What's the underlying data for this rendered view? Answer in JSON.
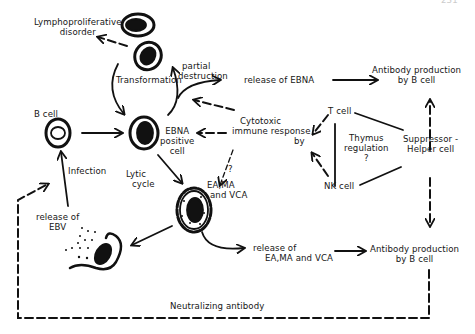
{
  "page_number": "231",
  "diagram": {
    "labels": {
      "lymphoproliferative_l1": "Lymphoproliferative",
      "lymphoproliferative_l2": "disorder",
      "transformation": "Transformation",
      "partial_l1": "partial",
      "partial_l2": "destruction",
      "release_ebna": "release of EBNA",
      "antibody_top_l1": "Antibody  production",
      "antibody_top_l2": "by   B  cell",
      "b_cell": "B cell",
      "ebna_l1": "EBNA",
      "ebna_l2": "positive",
      "ebna_l3": "cell",
      "cytotoxic_l1": "Cytotoxic",
      "cytotoxic_l2": "immune response",
      "cytotoxic_l3": "by",
      "t_cell": "T cell",
      "thymus_l1": "Thymus",
      "thymus_l2": "regulation",
      "thymus_l3": "?",
      "suppressor_l1": "Suppressor -",
      "suppressor_l2": "Helper  cell",
      "infection": "Infection",
      "lytic_l1": "Lytic",
      "lytic_l2": "cycle",
      "question_mark": "?",
      "ea_l1": "EA,MA",
      "ea_l2": "and VCA",
      "nk_cell": "NK cell",
      "release_ebv_l1": "release  of",
      "release_ebv_l2": "EBV",
      "release_ea_l1": "release  of",
      "release_ea_l2": "EA,MA and VCA",
      "antibody_bottom_l1": "Antibody  production",
      "antibody_bottom_l2": "by    B  cell",
      "neutralizing": "Neutralizing    antibody"
    },
    "nodes": [
      {
        "id": "transformed-cell-top",
        "type": "cell-dark-nucleus"
      },
      {
        "id": "transformed-cell",
        "type": "cell-dark-nucleus"
      },
      {
        "id": "b-cell",
        "type": "cell-hollow-nucleus"
      },
      {
        "id": "ebna-positive-cell",
        "type": "cell-dark-nucleus"
      },
      {
        "id": "lytic-cell",
        "type": "cell-spiky-dotted"
      },
      {
        "id": "lysed-cell",
        "type": "cell-ruptured"
      }
    ],
    "colors": {
      "ink": "#111111",
      "background": "#ffffff"
    }
  }
}
